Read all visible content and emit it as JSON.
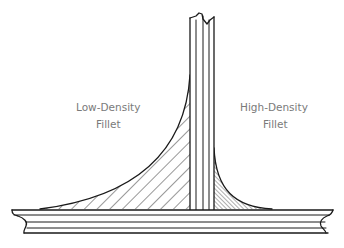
{
  "diagram": {
    "labels": {
      "low_density_line1": "Low-Density",
      "low_density_line2": "Fillet",
      "high_density_line1": "High-Density",
      "high_density_line2": "Fillet"
    },
    "colors": {
      "ink": "#1a1a1a",
      "label_text": "#7a7a7a",
      "background": "#ffffff"
    },
    "parts": [
      "vertical-web",
      "base-plate",
      "low-density-fillet",
      "high-density-fillet"
    ]
  }
}
